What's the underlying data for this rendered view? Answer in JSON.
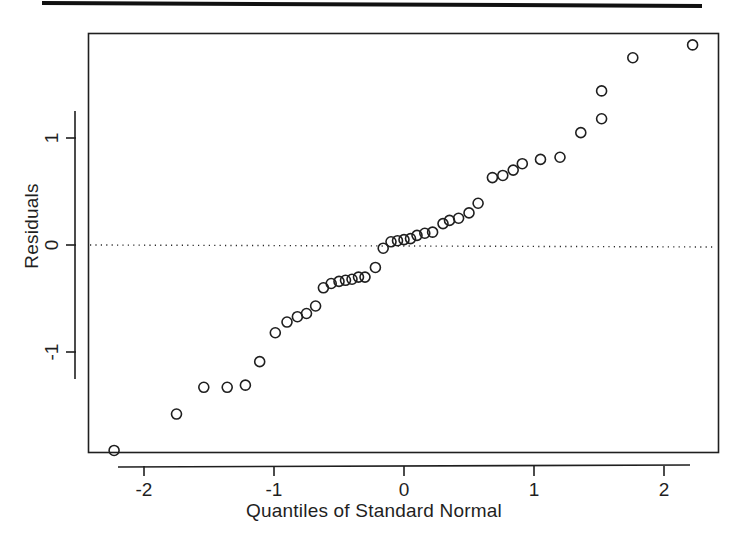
{
  "figure": {
    "kind": "qq-plot",
    "background_color": "#ffffff",
    "ink_color": "#1f1f1f",
    "has_top_rule": true
  },
  "chart_data": {
    "type": "scatter",
    "title": "",
    "xlabel": "Quantiles of Standard Normal",
    "ylabel": "Residuals",
    "xlim": [
      -2.42,
      2.42
    ],
    "ylim": [
      -1.99,
      2.03
    ],
    "xticks": [
      -2,
      -1,
      0,
      1,
      2
    ],
    "xtick_labels": [
      "-2",
      "-1",
      "0",
      "1",
      "2"
    ],
    "yticks": [
      -1,
      0,
      1
    ],
    "ytick_labels": [
      "-1",
      "0",
      "1"
    ],
    "grid": false,
    "legend": null,
    "reference_line": {
      "type": "horizontal-dotted",
      "y": 0.0,
      "style": "dotted"
    },
    "marker": {
      "shape": "open-circle",
      "radius_px": 5,
      "fill": "none",
      "stroke": "#1f1f1f",
      "stroke_width": 1.6
    },
    "n_points": 40,
    "x": [
      -2.23,
      -1.75,
      -1.54,
      -1.36,
      -1.22,
      -1.11,
      -0.99,
      -0.9,
      -0.82,
      -0.75,
      -0.68,
      -0.62,
      -0.56,
      -0.5,
      -0.45,
      -0.4,
      -0.35,
      -0.3,
      -0.22,
      -0.16,
      -0.1,
      -0.05,
      0.0,
      0.05,
      0.1,
      0.16,
      0.22,
      0.3,
      0.35,
      0.42,
      0.5,
      0.57,
      0.68,
      0.76,
      0.84,
      0.91,
      1.05,
      1.2,
      1.36,
      1.52
    ],
    "y": [
      -1.92,
      -1.58,
      -1.33,
      -1.33,
      -1.31,
      -1.09,
      -0.82,
      -0.72,
      -0.67,
      -0.64,
      -0.57,
      -0.4,
      -0.36,
      -0.34,
      -0.33,
      -0.32,
      -0.3,
      -0.3,
      -0.21,
      -0.03,
      0.03,
      0.04,
      0.05,
      0.06,
      0.09,
      0.11,
      0.12,
      0.2,
      0.23,
      0.25,
      0.3,
      0.39,
      0.63,
      0.65,
      0.7,
      0.76,
      0.8,
      0.82,
      1.05,
      1.18
    ],
    "extra_points": [
      {
        "x": 1.76,
        "y": 1.75
      },
      {
        "x": 2.22,
        "y": 1.87
      },
      {
        "x": 1.52,
        "y": 1.44
      }
    ]
  },
  "geometry": {
    "plot_frame": {
      "left": 88,
      "top": 33,
      "right": 718,
      "bottom": 452
    },
    "x_zero_px": 404,
    "y_zero_px": 245,
    "px_per_x_unit": 130,
    "px_per_y_unit": 107
  },
  "axis": {
    "xlabel": "Quantiles of Standard Normal",
    "ylabel": "Residuals",
    "xtick_labels": [
      "-2",
      "-1",
      "0",
      "1",
      "2"
    ],
    "ytick_labels": [
      "-1",
      "0",
      "1"
    ]
  }
}
